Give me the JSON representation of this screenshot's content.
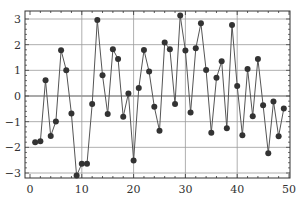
{
  "chart_data": {
    "type": "line",
    "title": "",
    "xlabel": "",
    "ylabel": "",
    "xlim": [
      -1,
      50
    ],
    "ylim": [
      -3.3,
      3.3
    ],
    "grid": true,
    "legend": null,
    "x_ticks": [
      0,
      10,
      20,
      30,
      40,
      50
    ],
    "y_ticks": [
      -3,
      -2,
      -1,
      0,
      1,
      2,
      3
    ],
    "x_tick_labels": [
      "0",
      "10",
      "20",
      "30",
      "40",
      "50"
    ],
    "y_tick_labels": [
      "−3",
      "−2",
      "−1",
      "0",
      "1",
      "2",
      "3"
    ],
    "gridlines_x": [
      10,
      20,
      30,
      40
    ],
    "gridlines_y": [
      -3,
      -2,
      -1,
      0,
      1,
      2,
      3
    ],
    "series": [
      {
        "name": "series",
        "marker": "circle",
        "color": "#333333",
        "x": [
          1,
          2,
          3,
          4,
          5,
          6,
          7,
          8,
          9,
          10,
          11,
          12,
          13,
          14,
          15,
          16,
          17,
          18,
          19,
          20,
          21,
          22,
          23,
          24,
          25,
          26,
          27,
          28,
          29,
          30,
          31,
          32,
          33,
          34,
          35,
          36,
          37,
          38,
          39,
          40,
          41,
          42,
          43,
          44,
          45,
          46,
          47,
          48,
          49
        ],
        "values": [
          -1.8,
          -1.76,
          0.61,
          -1.56,
          -0.99,
          1.78,
          1.0,
          -0.68,
          -3.1,
          -2.64,
          -2.64,
          -0.31,
          2.96,
          0.81,
          -0.7,
          1.82,
          1.44,
          -0.81,
          0.1,
          -2.51,
          0.31,
          1.79,
          0.95,
          -0.42,
          -1.35,
          2.08,
          1.82,
          -0.31,
          3.14,
          1.77,
          -0.64,
          1.86,
          2.83,
          1.01,
          -1.43,
          0.71,
          1.35,
          -1.26,
          2.77,
          0.39,
          -1.53,
          1.05,
          -0.79,
          1.44,
          -0.36,
          -2.23,
          -0.21,
          -1.57,
          -0.49
        ]
      }
    ]
  },
  "colors": {
    "line": "#555555",
    "marker": "#333333",
    "grid": "#9a9a9a",
    "zero_line": "#555555",
    "frame": "#333333"
  }
}
